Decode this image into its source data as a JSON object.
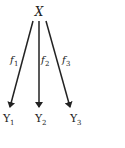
{
  "diagram": {
    "root": {
      "label": "X"
    },
    "edges": [
      {
        "label": "f",
        "sub": "1",
        "to": "Y1"
      },
      {
        "label": "f",
        "sub": "2",
        "to": "Y2"
      },
      {
        "label": "f",
        "sub": "3",
        "to": "Y3"
      }
    ],
    "targets": [
      {
        "label": "Y",
        "sub": "1"
      },
      {
        "label": "Y",
        "sub": "2"
      },
      {
        "label": "Y",
        "sub": "3"
      }
    ]
  }
}
